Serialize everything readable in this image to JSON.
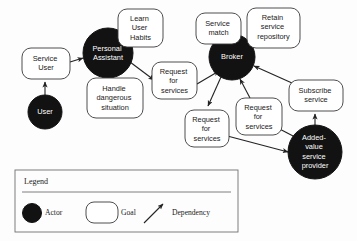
{
  "diagram": {
    "colors": {
      "actor_fill": "#121212",
      "actor_text": "#ffffff",
      "goal_fill": "#ffffff",
      "goal_stroke": "#3a3a3a",
      "goal_text": "#1a1a1a",
      "dependency_line": "#222222",
      "legend_stroke": "#6f6f6f",
      "background": "#fdfdfd"
    },
    "actors": [
      {
        "id": "user",
        "label": "User",
        "lines": [
          "User"
        ],
        "cx": 45,
        "cy": 112,
        "r": 17
      },
      {
        "id": "personal-assistant",
        "label": "Personal Assistant",
        "lines": [
          "Personal",
          "Assistant"
        ],
        "cx": 108,
        "cy": 53,
        "r": 25
      },
      {
        "id": "broker",
        "label": "Broker",
        "lines": [
          "Broker"
        ],
        "cx": 232,
        "cy": 57,
        "r": 23
      },
      {
        "id": "added-value-service-provider",
        "label": "Added-value service provider",
        "lines": [
          "Added-",
          "value",
          "service",
          "provider"
        ],
        "cx": 315,
        "cy": 152,
        "r": 27
      }
    ],
    "goals": [
      {
        "id": "service-user",
        "label": "Service User",
        "lines": [
          "Service",
          "User"
        ],
        "x": 22,
        "y": 48,
        "w": 48,
        "h": 31
      },
      {
        "id": "learn-user-habits",
        "label": "Learn User Habits",
        "lines": [
          "Learn",
          "User",
          "Habits"
        ],
        "x": 118,
        "y": 9,
        "w": 45,
        "h": 38
      },
      {
        "id": "handle-dangerous-situation",
        "label": "Handle dangerous situation",
        "lines": [
          "Handle",
          "dangerous",
          "situation"
        ],
        "x": 87,
        "y": 78,
        "w": 56,
        "h": 40
      },
      {
        "id": "request-for-services-1",
        "label": "Request for services",
        "lines": [
          "Request",
          "for",
          "services"
        ],
        "x": 152,
        "y": 62,
        "w": 45,
        "h": 37
      },
      {
        "id": "service-match",
        "label": "Service match",
        "lines": [
          "Service",
          "match"
        ],
        "x": 196,
        "y": 13,
        "w": 45,
        "h": 31
      },
      {
        "id": "retain-service-repository",
        "label": "Retain service repository",
        "lines": [
          "Retain",
          "service",
          "repository"
        ],
        "x": 247,
        "y": 8,
        "w": 53,
        "h": 40
      },
      {
        "id": "request-for-services-2",
        "label": "Request for services",
        "lines": [
          "Request",
          "for",
          "services"
        ],
        "x": 185,
        "y": 110,
        "w": 44,
        "h": 37
      },
      {
        "id": "request-for-services-3",
        "label": "Request for services",
        "lines": [
          "Request",
          "for",
          "services"
        ],
        "x": 236,
        "y": 98,
        "w": 46,
        "h": 37
      },
      {
        "id": "subscribe-service",
        "label": "Subscribe service",
        "lines": [
          "Subscribe",
          "service"
        ],
        "x": 289,
        "y": 80,
        "w": 54,
        "h": 31
      }
    ],
    "dependencies": [
      {
        "id": "user-to-service-user",
        "from": "user",
        "to": "service-user"
      },
      {
        "id": "service-user-to-personal-assistant",
        "from": "service-user",
        "to": "personal-assistant"
      },
      {
        "id": "personal-assistant-to-request-for-services-1",
        "from": "personal-assistant",
        "to": "request-for-services-1"
      },
      {
        "id": "request-for-services-1-to-broker",
        "from": "request-for-services-1",
        "to": "broker"
      },
      {
        "id": "broker-to-request-for-services-2",
        "from": "broker",
        "to": "request-for-services-2"
      },
      {
        "id": "request-for-services-3-to-broker",
        "from": "request-for-services-3",
        "to": "broker"
      },
      {
        "id": "added-value-to-request-for-services-3",
        "from": "added-value-service-provider",
        "to": "request-for-services-3"
      },
      {
        "id": "request-for-services-2-to-added-value",
        "from": "request-for-services-2",
        "to": "added-value-service-provider"
      },
      {
        "id": "added-value-to-subscribe-service",
        "from": "added-value-service-provider",
        "to": "subscribe-service"
      },
      {
        "id": "subscribe-service-to-broker",
        "from": "subscribe-service",
        "to": "broker"
      }
    ]
  },
  "legend": {
    "title": "Legend",
    "items": [
      {
        "id": "legend-actor",
        "symbol": "filled-circle",
        "label": "Actor"
      },
      {
        "id": "legend-goal",
        "symbol": "rounded-rect",
        "label": "Goal"
      },
      {
        "id": "legend-dependency",
        "symbol": "arrow",
        "label": "Dependency"
      }
    ]
  }
}
